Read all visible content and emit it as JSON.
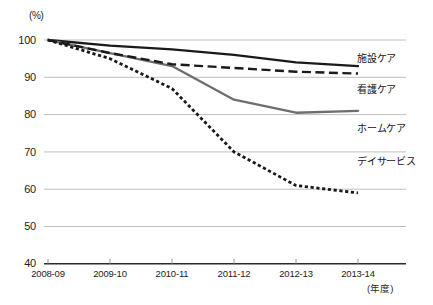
{
  "chart_data": {
    "type": "line",
    "title": "",
    "xlabel": "年度",
    "ylabel": "(%)",
    "ylim": [
      40,
      100
    ],
    "yticks": [
      100,
      90,
      80,
      70,
      60,
      50,
      40
    ],
    "grid": true,
    "legend_position": "right-inline",
    "categories": [
      "2008-09",
      "2009-10",
      "2010-11",
      "2011-12",
      "2012-13",
      "2013-14"
    ],
    "series": [
      {
        "name": "施設ケア",
        "style": "solid",
        "color": "#1a1a1a",
        "values": [
          100,
          98.5,
          97.5,
          96,
          94,
          93
        ]
      },
      {
        "name": "看護ケア",
        "style": "dashed",
        "color": "#1a1a1a",
        "values": [
          100,
          96.5,
          93.5,
          92.5,
          91.5,
          91
        ]
      },
      {
        "name": "ホームケア",
        "style": "solid",
        "color": "#6e6e6e",
        "values": [
          100,
          96.5,
          93,
          84,
          80.5,
          81
        ]
      },
      {
        "name": "デイサービス",
        "style": "dotted",
        "color": "#1a1a1a",
        "values": [
          100,
          95,
          87,
          70,
          61,
          59
        ]
      }
    ]
  },
  "axis": {
    "unit_top": "(%)",
    "unit_bottom": "(年度)",
    "ytick_labels": [
      "100",
      "90",
      "80",
      "70",
      "60",
      "50",
      "40"
    ],
    "xtick_labels": [
      "2008-09",
      "2009-10",
      "2010-11",
      "2011-12",
      "2012-13",
      "2013-14"
    ]
  },
  "legend": {
    "items": [
      {
        "label": "施設ケア"
      },
      {
        "label": "看護ケア"
      },
      {
        "label": "ホームケア"
      },
      {
        "label": "デイサービス"
      }
    ]
  },
  "colors": {
    "gridline": "#b9b9b9",
    "axis": "#2b2b2b",
    "series_dark": "#1a1a1a",
    "series_gray": "#6e6e6e",
    "background": "#ffffff"
  }
}
